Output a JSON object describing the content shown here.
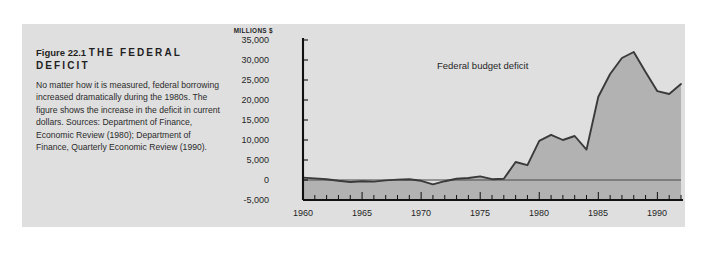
{
  "figure": {
    "number_label": "Figure 22.1",
    "headline": "THE FEDERAL DEFICIT",
    "caption": "No matter how it is measured, federal borrowing increased dramatically during the 1980s. The figure shows the increase in the deficit in current dollars. Sources: Department of Finance, Economic Review (1980); Department of Finance, Quarterly Economic Review (1990)."
  },
  "colors": {
    "page_background": "#ffffff",
    "panel_background": "#dfdfdf",
    "rule_bar": "#8a8a8a",
    "area_fill": "#b2b2b2",
    "line": "#3a3a3a",
    "axis": "#111111",
    "text": "#1f1f1f"
  },
  "chart_data": {
    "type": "area",
    "title": "",
    "subtitle": "",
    "xlabel": "",
    "ylabel": "MILLIONS $",
    "annotation": "Federal budget deficit",
    "grid": false,
    "legend_position": "inline-annotation",
    "xlim": [
      1960,
      1992
    ],
    "ylim": [
      -5000,
      35000
    ],
    "ytick_labels": [
      "35,000",
      "30,000",
      "25,000",
      "20,000",
      "15,000",
      "10,000",
      "5,000",
      "0",
      "-5,000"
    ],
    "ytick_values": [
      35000,
      30000,
      25000,
      20000,
      15000,
      10000,
      5000,
      0,
      -5000
    ],
    "xtick_labels": [
      "1960",
      "1965",
      "1970",
      "1975",
      "1980",
      "1985",
      "1990"
    ],
    "xtick_values": [
      1960,
      1965,
      1970,
      1975,
      1980,
      1985,
      1990
    ],
    "minor_xtick_interval": 1,
    "series": [
      {
        "name": "Federal budget deficit",
        "x": [
          1960,
          1961,
          1962,
          1963,
          1964,
          1965,
          1966,
          1967,
          1968,
          1969,
          1970,
          1971,
          1972,
          1973,
          1974,
          1975,
          1976,
          1977,
          1978,
          1979,
          1980,
          1981,
          1982,
          1983,
          1984,
          1985,
          1986,
          1987,
          1988,
          1989,
          1990,
          1991,
          1992
        ],
        "values": [
          600,
          400,
          200,
          -200,
          -500,
          -300,
          -400,
          -100,
          100,
          200,
          -200,
          -1100,
          -300,
          300,
          500,
          900,
          200,
          300,
          4500,
          3700,
          9800,
          11300,
          10000,
          11000,
          7600,
          20800,
          26500,
          30500,
          32000,
          27000,
          22200,
          21500,
          24000
        ],
        "values_note": "approximate, read from axis",
        "peak_year": 1985,
        "peak_value": 32000
      }
    ]
  }
}
